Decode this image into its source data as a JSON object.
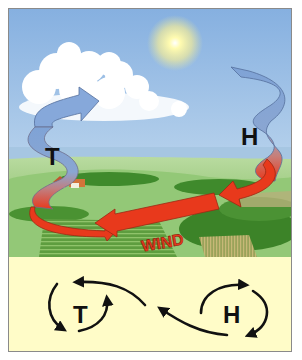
{
  "diagram": {
    "illustration": {
      "low_pressure_label": "T",
      "high_pressure_label": "H",
      "wind_label": "WIND"
    },
    "schematic": {
      "low_pressure_label": "T",
      "high_pressure_label": "H"
    },
    "colors": {
      "sky_top": "#8fb6e3",
      "sky_bottom": "#cfe2f1",
      "sea": "#a9c9e4",
      "meadow": "#8cc46a",
      "ribbon_blue": "#7fa3d6",
      "ribbon_red": "#e8391c",
      "schematic_bg": "#fffcc8",
      "frame_border": "#8a8a8a"
    }
  }
}
